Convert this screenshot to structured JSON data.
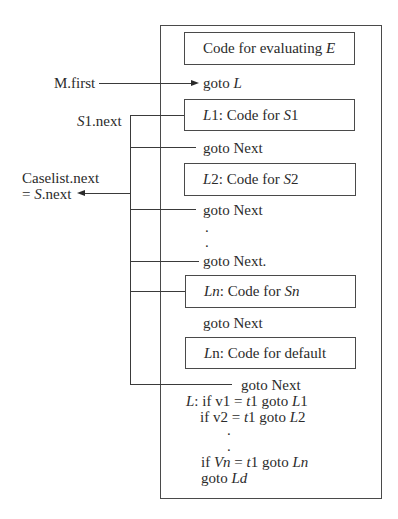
{
  "diagram": {
    "type": "switch-statement code layout",
    "outer_box": {
      "label": "generated code block"
    },
    "boxes": [
      {
        "id": "eval",
        "parts": [
          [
            "Code for evaluating ",
            false
          ],
          [
            "E",
            true
          ]
        ]
      },
      {
        "id": "s1",
        "parts": [
          [
            "L",
            true
          ],
          [
            "1: Code for ",
            false
          ],
          [
            "S",
            true
          ],
          [
            "1",
            false
          ]
        ]
      },
      {
        "id": "s2",
        "parts": [
          [
            "L",
            true
          ],
          [
            "2: Code for ",
            false
          ],
          [
            "S",
            true
          ],
          [
            "2",
            false
          ]
        ]
      },
      {
        "id": "sn",
        "parts": [
          [
            "Ln",
            true
          ],
          [
            ": Code for ",
            false
          ],
          [
            "Sn",
            true
          ]
        ]
      },
      {
        "id": "default",
        "parts": [
          [
            "L",
            true
          ],
          [
            "n: Code for default",
            false
          ]
        ]
      }
    ],
    "goto_lines": {
      "goto_L": [
        [
          "goto ",
          false
        ],
        [
          "L",
          true
        ]
      ],
      "goto_next_1": [
        [
          "goto Next",
          false
        ]
      ],
      "goto_next_2": [
        [
          "goto Next",
          false
        ]
      ],
      "dot_1": ".",
      "dot_2": ".",
      "goto_next_3": [
        [
          "goto Next.",
          false
        ]
      ],
      "goto_next_4": [
        [
          "goto Next",
          false
        ]
      ],
      "goto_next_5": [
        [
          "goto Next",
          false
        ]
      ]
    },
    "test_code": [
      [
        [
          "L",
          true
        ],
        [
          ": if v1 = ",
          false
        ],
        [
          "t",
          true
        ],
        [
          "1 goto ",
          false
        ],
        [
          "L",
          true
        ],
        [
          "1",
          false
        ]
      ],
      [
        [
          "if v2 = ",
          false
        ],
        [
          "t",
          true
        ],
        [
          "1 goto ",
          false
        ],
        [
          "L",
          true
        ],
        [
          "2",
          false
        ]
      ],
      [
        [
          ".",
          false
        ]
      ],
      [
        [
          ".",
          false
        ]
      ],
      [
        [
          "if ",
          false
        ],
        [
          "Vn",
          true
        ],
        [
          " = ",
          false
        ],
        [
          "t",
          true
        ],
        [
          "1 goto ",
          false
        ],
        [
          "Ln",
          true
        ]
      ],
      [
        [
          "goto ",
          false
        ],
        [
          "Ld",
          true
        ]
      ]
    ],
    "left_labels": {
      "m_first": [
        [
          "M.first",
          false
        ]
      ],
      "s1_next": [
        [
          "S",
          true
        ],
        [
          "1.next",
          false
        ]
      ],
      "caselist_line1": [
        [
          "Caselist.next",
          false
        ]
      ],
      "caselist_line2": [
        [
          "= ",
          false
        ],
        [
          "S",
          true
        ],
        [
          ".next",
          false
        ]
      ]
    },
    "colors": {
      "line": "#3a3a3a",
      "text": "#2b2b2b",
      "background": "#ffffff"
    }
  }
}
